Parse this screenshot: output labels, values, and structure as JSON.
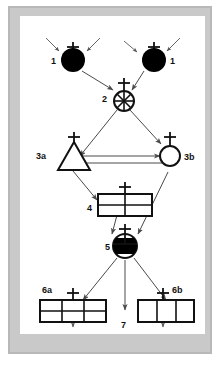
{
  "figure": {
    "frame_color": "#b8b8b8",
    "background_color": "#ffffff",
    "ink_color": "#111111",
    "arrow_color": "#4a4a4a"
  },
  "labels": {
    "stage1_left": "1",
    "stage1_right": "1",
    "stage2": "2",
    "stage3a": "3a",
    "stage3b": "3b",
    "stage4": "4",
    "stage5": "5",
    "stage6a": "6a",
    "stage6b": "6b",
    "stage7": "7"
  },
  "nodes": [
    {
      "id": "stage1_left",
      "label": "1",
      "shape": "filled-circle",
      "has_cross": true,
      "fill": "#000000",
      "label_position": "left"
    },
    {
      "id": "stage1_right",
      "label": "1",
      "shape": "filled-circle",
      "has_cross": true,
      "fill": "#000000",
      "label_position": "right"
    },
    {
      "id": "stage2",
      "label": "2",
      "shape": "spoked-circle",
      "has_cross": true,
      "fill": "#ffffff",
      "label_position": "left"
    },
    {
      "id": "stage3a",
      "label": "3a",
      "shape": "triangle",
      "has_cross": true,
      "fill": "#ffffff",
      "label_position": "left"
    },
    {
      "id": "stage3b",
      "label": "3b",
      "shape": "open-circle",
      "has_cross": true,
      "fill": "#ffffff",
      "label_position": "right"
    },
    {
      "id": "stage4",
      "label": "4",
      "shape": "grid-2x2",
      "has_cross": true,
      "fill": "#ffffff",
      "label_position": "left"
    },
    {
      "id": "stage5",
      "label": "5",
      "shape": "half-filled-circle",
      "has_cross": true,
      "fill": "#000000",
      "label_position": "left"
    },
    {
      "id": "stage6a",
      "label": "6a",
      "shape": "grid-3x2",
      "has_cross": true,
      "fill": "#ffffff",
      "label_position": "top-left"
    },
    {
      "id": "stage6b",
      "label": "6b",
      "shape": "grid-3x1",
      "has_cross": true,
      "fill": "#ffffff",
      "label_position": "top-right"
    },
    {
      "id": "stage7",
      "label": "7",
      "shape": "arrow-terminus",
      "has_cross": false,
      "fill": "none",
      "label_position": "below"
    }
  ],
  "edges": [
    {
      "from": "external",
      "to": "stage1_left",
      "style": "short-inbound-arrow"
    },
    {
      "from": "external",
      "to": "stage1_left",
      "style": "short-inbound-arrow"
    },
    {
      "from": "external",
      "to": "stage1_right",
      "style": "short-inbound-arrow"
    },
    {
      "from": "external",
      "to": "stage1_right",
      "style": "short-inbound-arrow"
    },
    {
      "from": "stage1_left",
      "to": "stage2",
      "style": "arrow"
    },
    {
      "from": "stage1_right",
      "to": "stage2",
      "style": "arrow"
    },
    {
      "from": "stage2",
      "to": "stage3a",
      "style": "arrow"
    },
    {
      "from": "stage2",
      "to": "stage3b",
      "style": "arrow"
    },
    {
      "from": "stage3a",
      "to": "stage3b",
      "style": "arrow"
    },
    {
      "from": "stage3b",
      "to": "stage3a",
      "style": "arrow"
    },
    {
      "from": "stage3a",
      "to": "stage4",
      "style": "arrow"
    },
    {
      "from": "stage4",
      "to": "stage5",
      "style": "arrow"
    },
    {
      "from": "stage3b",
      "to": "stage5",
      "style": "arrow"
    },
    {
      "from": "stage5",
      "to": "stage6a",
      "style": "arrow"
    },
    {
      "from": "stage5",
      "to": "stage6b",
      "style": "arrow"
    },
    {
      "from": "stage5",
      "to": "stage7",
      "style": "arrow"
    },
    {
      "from": "stage6a",
      "to": "external",
      "style": "short-outbound-arrow"
    },
    {
      "from": "stage6b",
      "to": "external",
      "style": "short-outbound-arrow"
    }
  ]
}
